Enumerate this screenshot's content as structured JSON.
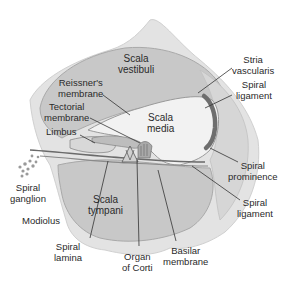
{
  "diagram": {
    "colors": {
      "bone": "#e2e2e2",
      "bone_edge": "#cfcfcf",
      "scala_fill": "#c9c9c9",
      "scala_edge": "#a8a8a8",
      "media_fill": "#f2f2f2",
      "stria": "#6e6e6e",
      "leader": "#333333",
      "text": "#2a2a2a"
    },
    "labels": {
      "scala_vestibuli": "Scala\nvestibuli",
      "reissners_membrane": "Reissner's\nmembrane",
      "tectorial_membrane": "Tectorial\nmembrane",
      "limbus": "Limbus",
      "scala_media": "Scala\nmedia",
      "stria_vascularis": "Stria\nvascularis",
      "spiral_ligament_upper": "Spiral\nligament",
      "spiral_prominence": "Spiral\nprominence",
      "spiral_ligament_lower": "Spiral\nligament",
      "spiral_ganglion": "Spiral\nganglion",
      "modiolus": "Modiolus",
      "scala_tympani": "Scala\ntympani",
      "spiral_lamina": "Spiral\nlamina",
      "organ_of_corti": "Organ\nof Corti",
      "basilar_membrane": "Basilar\nmembrane"
    }
  }
}
